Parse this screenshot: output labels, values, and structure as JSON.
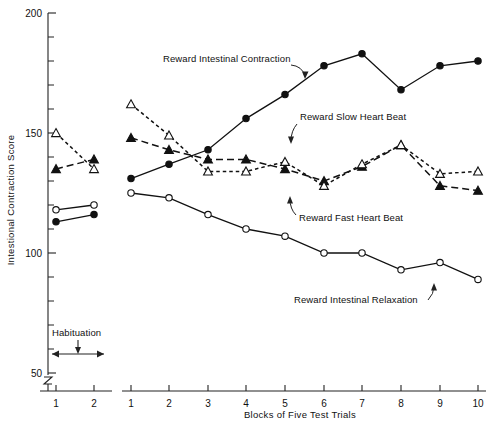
{
  "chart_data": {
    "type": "line",
    "title": "",
    "xlabel": "Blocks of Five Test Trials",
    "ylabel": "Intestional Contraction Score",
    "ylim": [
      50,
      200
    ],
    "y_major_ticks": [
      50,
      100,
      150,
      200
    ],
    "y_minor_step": 10,
    "grid": false,
    "legend_position": "inline-annotations",
    "habituation_label": "Habituation",
    "habituation_categories": [
      "1",
      "2"
    ],
    "categories": [
      "1",
      "2",
      "3",
      "4",
      "5",
      "6",
      "7",
      "8",
      "9",
      "10"
    ],
    "series": [
      {
        "name": "Reward Intestinal Contraction",
        "marker": "filled-circle",
        "line": "solid",
        "habituation_values": [
          113,
          116
        ],
        "values": [
          131,
          137,
          143,
          156,
          166,
          178,
          183,
          168,
          178,
          180
        ]
      },
      {
        "name": "Reward Slow Heart Beat",
        "marker": "filled-triangle",
        "line": "dashed",
        "habituation_values": [
          135,
          139
        ],
        "values": [
          148,
          143,
          139,
          139,
          135,
          130,
          136,
          145,
          128,
          126
        ]
      },
      {
        "name": "Reward Fast Heart Beat",
        "marker": "open-triangle",
        "line": "dotted",
        "habituation_values": [
          150,
          135
        ],
        "values": [
          162,
          149,
          134,
          134,
          138,
          128,
          137,
          145,
          133,
          134
        ]
      },
      {
        "name": "Reward Intestinal Relaxation",
        "marker": "open-circle",
        "line": "solid",
        "habituation_values": [
          118,
          120
        ],
        "values": [
          125,
          123,
          116,
          110,
          107,
          100,
          100,
          93,
          96,
          89
        ]
      }
    ],
    "annotations": [
      {
        "text": "Reward  Intestinal Contraction"
      },
      {
        "text": "Reward Slow Heart Beat"
      },
      {
        "text": "Reward Fast Heart Beat"
      },
      {
        "text": "Reward Intestinal Relaxation"
      }
    ]
  },
  "axis": {
    "y_label_200": "200",
    "y_label_150": "150",
    "y_label_100": "100",
    "y_label_50": "50",
    "y_title": "Intestional Contraction Score",
    "x_title": "Blocks of Five Test Trials",
    "hab_tick_1": "1",
    "hab_tick_2": "2",
    "t1": "1",
    "t2": "2",
    "t3": "3",
    "t4": "4",
    "t5": "5",
    "t6": "6",
    "t7": "7",
    "t8": "8",
    "t9": "9",
    "t10": "10"
  },
  "annot": {
    "habituation": "Habituation",
    "contraction": "Reward  Intestinal Contraction",
    "slow_hb": "Reward Slow Heart Beat",
    "fast_hb": "Reward Fast Heart Beat",
    "relaxation": "Reward Intestinal Relaxation"
  }
}
